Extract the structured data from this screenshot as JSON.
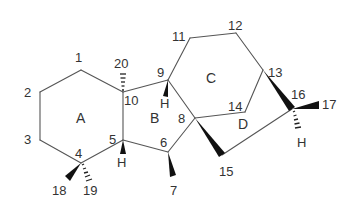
{
  "diagram": {
    "title": "",
    "rings": [
      {
        "id": "A",
        "label": "A",
        "x": 76,
        "y": 123
      },
      {
        "id": "B",
        "label": "B",
        "x": 150,
        "y": 123
      },
      {
        "id": "C",
        "label": "C",
        "x": 206,
        "y": 83
      },
      {
        "id": "D",
        "label": "D",
        "x": 238,
        "y": 129
      }
    ],
    "atoms": [
      {
        "id": "1",
        "label": "1",
        "x": 75,
        "y": 62
      },
      {
        "id": "2",
        "label": "2",
        "x": 24,
        "y": 97
      },
      {
        "id": "3",
        "label": "3",
        "x": 24,
        "y": 144
      },
      {
        "id": "4",
        "label": "4",
        "x": 75,
        "y": 158
      },
      {
        "id": "5",
        "label": "5",
        "x": 109,
        "y": 144
      },
      {
        "id": "6",
        "label": "6",
        "x": 160,
        "y": 147
      },
      {
        "id": "7",
        "label": "7",
        "x": 170,
        "y": 195
      },
      {
        "id": "8",
        "label": "8",
        "x": 178,
        "y": 123
      },
      {
        "id": "9",
        "label": "9",
        "x": 157,
        "y": 77
      },
      {
        "id": "10",
        "label": "10",
        "x": 124,
        "y": 105
      },
      {
        "id": "11",
        "label": "11",
        "x": 172,
        "y": 41
      },
      {
        "id": "12",
        "label": "12",
        "x": 228,
        "y": 30
      },
      {
        "id": "13",
        "label": "13",
        "x": 268,
        "y": 77
      },
      {
        "id": "14",
        "label": "14",
        "x": 228,
        "y": 111
      },
      {
        "id": "15",
        "label": "15",
        "x": 219,
        "y": 176
      },
      {
        "id": "16",
        "label": "16",
        "x": 291,
        "y": 99
      },
      {
        "id": "17",
        "label": "17",
        "x": 322,
        "y": 109
      },
      {
        "id": "18",
        "label": "18",
        "x": 52,
        "y": 195
      },
      {
        "id": "19",
        "label": "19",
        "x": 83,
        "y": 195
      },
      {
        "id": "20",
        "label": "20",
        "x": 114,
        "y": 68
      }
    ],
    "hydrogens": [
      {
        "on": "9",
        "label": "H",
        "x": 160,
        "y": 108
      },
      {
        "on": "5",
        "label": "H",
        "x": 117,
        "y": 167
      },
      {
        "on": "16",
        "label": "H",
        "x": 297,
        "y": 147
      }
    ]
  }
}
